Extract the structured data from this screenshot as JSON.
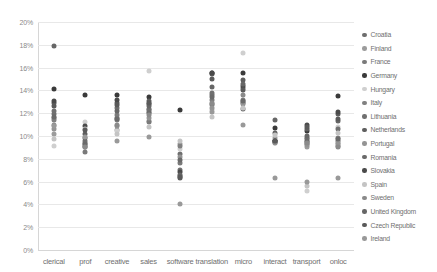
{
  "chart_data": {
    "type": "scatter",
    "title": "",
    "xlabel": "",
    "ylabel": "",
    "ylim": [
      0,
      20
    ],
    "ytick_labels": [
      "0%",
      "2%",
      "4%",
      "6%",
      "8%",
      "10%",
      "12%",
      "14%",
      "16%",
      "18%",
      "20%"
    ],
    "ytick_values": [
      0,
      2,
      4,
      6,
      8,
      10,
      12,
      14,
      16,
      18,
      20
    ],
    "y_unit": "%",
    "grid": true,
    "legend_position": "right",
    "categories": [
      "clerical",
      "prof",
      "creative",
      "sales",
      "software",
      "translation",
      "micro",
      "interact",
      "transport",
      "onloc"
    ],
    "legend_entries": [
      {
        "name": "Croatia",
        "color": "#6e6e6e"
      },
      {
        "name": "Finland",
        "color": "#9c9c9c"
      },
      {
        "name": "France",
        "color": "#7a7a7a"
      },
      {
        "name": "Germany",
        "color": "#3a3a3a"
      },
      {
        "name": "Hungary",
        "color": "#cfcfcf"
      },
      {
        "name": "Italy",
        "color": "#808080"
      },
      {
        "name": "Lithuania",
        "color": "#707070"
      },
      {
        "name": "Netherlands",
        "color": "#5e5e5e"
      },
      {
        "name": "Portugal",
        "color": "#949494"
      },
      {
        "name": "Romania",
        "color": "#6a6a6a"
      },
      {
        "name": "Slovakia",
        "color": "#4a4a4a"
      },
      {
        "name": "Spain",
        "color": "#c4c4c4"
      },
      {
        "name": "Sweden",
        "color": "#8a8a8a"
      },
      {
        "name": "United Kingdom",
        "color": "#666666"
      },
      {
        "name": "Czech Republic",
        "color": "#5a5a5a"
      },
      {
        "name": "Ireland",
        "color": "#999999"
      }
    ],
    "series": [
      {
        "name": "Croatia",
        "color": "#6e6e6e",
        "values": [
          11.9,
          9.0,
          11.6,
          12.3,
          8.4,
          13.6,
          12.4,
          9.6,
          9.5,
          9.6
        ]
      },
      {
        "name": "Finland",
        "color": "#9c9c9c",
        "values": [
          10.2,
          9.2,
          10.5,
          11.3,
          9.3,
          12.7,
          13.0,
          9.8,
          9.0,
          9.4
        ]
      },
      {
        "name": "France",
        "color": "#7a7a7a",
        "values": [
          11.6,
          8.6,
          11.8,
          11.2,
          7.6,
          13.2,
          12.9,
          9.5,
          9.3,
          9.1
        ]
      },
      {
        "name": "Germany",
        "color": "#3a3a3a",
        "values": [
          14.1,
          13.6,
          13.6,
          13.4,
          12.3,
          15.5,
          15.5,
          10.7,
          10.4,
          13.5
        ]
      },
      {
        "name": "Hungary",
        "color": "#cfcfcf",
        "values": [
          9.1,
          11.2,
          10.4,
          15.7,
          8.9,
          12.3,
          17.3,
          9.4,
          5.2,
          10.8
        ]
      },
      {
        "name": "Italy",
        "color": "#808080",
        "values": [
          11.4,
          9.4,
          11.4,
          12.1,
          9.1,
          12.8,
          13.2,
          9.6,
          9.7,
          9.8
        ]
      },
      {
        "name": "Lithuania",
        "color": "#707070",
        "values": [
          12.2,
          9.6,
          12.5,
          12.4,
          7.0,
          13.8,
          14.2,
          9.5,
          9.8,
          10.6
        ]
      },
      {
        "name": "Netherlands",
        "color": "#5e5e5e",
        "values": [
          12.9,
          10.2,
          12.9,
          13.1,
          6.3,
          15.4,
          14.9,
          10.3,
          10.6,
          11.9
        ]
      },
      {
        "name": "Portugal",
        "color": "#949494",
        "values": [
          10.6,
          9.1,
          10.9,
          11.6,
          8.2,
          12.5,
          12.8,
          9.4,
          9.2,
          9.3
        ]
      },
      {
        "name": "Romania",
        "color": "#6a6a6a",
        "values": [
          11.7,
          9.3,
          11.5,
          12.0,
          7.9,
          13.4,
          13.1,
          9.6,
          9.6,
          9.7
        ]
      },
      {
        "name": "Slovakia",
        "color": "#4a4a4a",
        "values": [
          13.1,
          10.9,
          13.2,
          12.8,
          6.8,
          15.5,
          14.4,
          9.6,
          11.0,
          12.1
        ]
      },
      {
        "name": "Spain",
        "color": "#c4c4c4",
        "values": [
          9.7,
          10.6,
          10.2,
          10.8,
          9.6,
          11.7,
          12.5,
          10.1,
          5.6,
          10.3
        ]
      },
      {
        "name": "Sweden",
        "color": "#8a8a8a",
        "values": [
          11.0,
          9.0,
          11.0,
          11.8,
          6.5,
          12.9,
          13.6,
          9.5,
          9.4,
          9.0
        ]
      },
      {
        "name": "United Kingdom",
        "color": "#666666",
        "values": [
          17.9,
          9.8,
          12.2,
          12.6,
          6.6,
          14.3,
          14.6,
          11.4,
          10.0,
          11.3
        ]
      },
      {
        "name": "Czech Republic",
        "color": "#5a5a5a",
        "values": [
          12.6,
          10.5,
          12.7,
          12.9,
          6.4,
          15.0,
          14.0,
          9.6,
          10.8,
          11.5
        ]
      },
      {
        "name": "Ireland",
        "color": "#999999",
        "values": [
          10.9,
          9.9,
          9.6,
          9.9,
          4.0,
          12.1,
          11.0,
          6.3,
          6.0,
          6.3
        ]
      }
    ]
  }
}
